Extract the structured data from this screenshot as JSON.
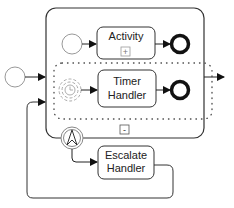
{
  "diagram": {
    "type": "BPMN",
    "subprocess": {
      "collapse_marker": "-"
    },
    "tasks": {
      "activity": {
        "label": "Activity",
        "marker": "+"
      },
      "timer_handler": {
        "line1": "Timer",
        "line2": "Handler"
      },
      "escalate_handler": {
        "line1": "Escalate",
        "line2": "Handler"
      }
    },
    "events": {
      "outer_start": "start-event",
      "inner_start": "start-event",
      "activity_end": "end-event",
      "timer_start": "timer-start-event",
      "timer_end": "end-event",
      "escalation_boundary": "escalation-boundary-event"
    },
    "colors": {
      "stroke": "#222222",
      "light_stroke": "#9a9a9a",
      "background": "#ffffff"
    }
  }
}
